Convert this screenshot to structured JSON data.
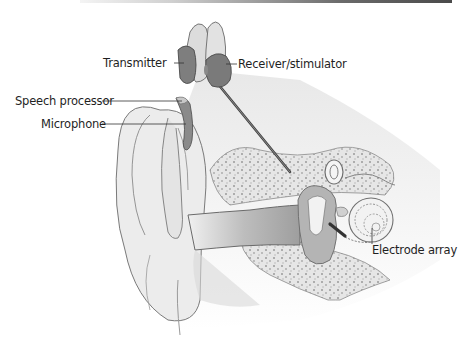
{
  "diagram": {
    "labels": {
      "transmitter": "Transmitter",
      "receiver_stimulator": "Receiver/stimulator",
      "speech_processor": "Speech processor",
      "microphone": "Microphone",
      "electrode_array": "Electrode array"
    },
    "colors": {
      "device_dark": "#7a7a7a",
      "device_light": "#d6d6d6",
      "skin": "#ececec",
      "canal_shadow": "#b5b5b5",
      "bone": "#e2e2e2",
      "outline": "#6a6a6a",
      "leader_line": "#333333"
    }
  }
}
